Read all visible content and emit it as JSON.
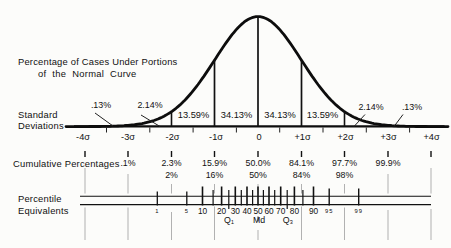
{
  "title": {
    "line1": "Percentage of Cases Under Portions",
    "line2": "of the Normal Curve"
  },
  "curve_region_labels": [
    ".13%",
    "2.14%",
    "13.59%",
    "34.13%",
    "34.13%",
    "13.59%",
    "2.14%",
    ".13%"
  ],
  "axis": {
    "label_line1": "Standard",
    "label_line2": "Deviations",
    "ticks": [
      "-4σ",
      "-3σ",
      "-2σ",
      "-1σ",
      "0",
      "+1σ",
      "+2σ",
      "+3σ",
      "+4σ"
    ]
  },
  "cumulative": {
    "label": "Cumulative Percentages",
    "row1": [
      ".1%",
      "2.3%",
      "15.9%",
      "50.0%",
      "84.1%",
      "97.7%",
      "99.9%"
    ],
    "row2": [
      "2%",
      "16%",
      "50%",
      "84%",
      "98%"
    ]
  },
  "percentile": {
    "label_line1": "Percentile",
    "label_line2": "Equivalents",
    "major_labels": [
      "10",
      "20",
      "30",
      "40",
      "50",
      "60",
      "70",
      "80",
      "90"
    ],
    "small_labels": [
      "1",
      "5",
      "95",
      "99"
    ],
    "quartile_labels": [
      "Q₁",
      "Md",
      "Q₃"
    ]
  },
  "colors": {
    "ink": "#111111",
    "faint_line": "#a8a8a8",
    "background": "#fcfcfa"
  },
  "chart_data": {
    "type": "area",
    "title": "Percentage of Cases Under Portions of the Normal Curve",
    "xlabel": "Standard Deviations",
    "x_ticks": [
      "-4σ",
      "-3σ",
      "-2σ",
      "-1σ",
      "0",
      "+1σ",
      "+2σ",
      "+3σ",
      "+4σ"
    ],
    "distribution": "standard normal curve",
    "segment_percentages": {
      "categories": [
        "-4σ to -3σ",
        "-3σ to -2σ",
        "-2σ to -1σ",
        "-1σ to 0",
        "0 to +1σ",
        "+1σ to +2σ",
        "+2σ to +3σ",
        "+3σ to +4σ"
      ],
      "values": [
        0.13,
        2.14,
        13.59,
        34.13,
        34.13,
        13.59,
        2.14,
        0.13
      ]
    },
    "cumulative_percentages": {
      "sigma": [
        -3,
        -2,
        -1,
        0,
        1,
        2,
        3
      ],
      "exact": [
        0.1,
        2.3,
        15.9,
        50.0,
        84.1,
        97.7,
        99.9
      ],
      "rounded": [
        null,
        2,
        16,
        50,
        84,
        98,
        null
      ]
    },
    "percentile_equivalents": {
      "tick_labels": [
        1,
        5,
        10,
        20,
        30,
        40,
        50,
        60,
        70,
        80,
        90,
        95,
        99
      ],
      "minor_ticks_every": 5,
      "quartiles": {
        "Q1": 25,
        "Md": 50,
        "Q3": 75
      }
    },
    "xlim": [
      -4,
      4
    ],
    "grid": false,
    "legend": false
  }
}
